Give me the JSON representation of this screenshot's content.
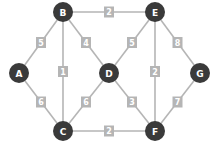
{
  "graph": {
    "node_color": "#3a3a3a",
    "edge_color": "#b5b5b5",
    "nodes": [
      {
        "id": "A",
        "x": 19,
        "y": 73
      },
      {
        "id": "B",
        "x": 63,
        "y": 12
      },
      {
        "id": "C",
        "x": 63,
        "y": 131
      },
      {
        "id": "D",
        "x": 109,
        "y": 73
      },
      {
        "id": "E",
        "x": 155,
        "y": 12
      },
      {
        "id": "F",
        "x": 155,
        "y": 131
      },
      {
        "id": "G",
        "x": 200,
        "y": 73
      }
    ],
    "edges": [
      {
        "from": "A",
        "to": "B",
        "weight": "5"
      },
      {
        "from": "A",
        "to": "C",
        "weight": "6"
      },
      {
        "from": "B",
        "to": "C",
        "weight": "1"
      },
      {
        "from": "B",
        "to": "D",
        "weight": "4"
      },
      {
        "from": "B",
        "to": "E",
        "weight": "2"
      },
      {
        "from": "C",
        "to": "D",
        "weight": "6"
      },
      {
        "from": "C",
        "to": "F",
        "weight": "2"
      },
      {
        "from": "D",
        "to": "E",
        "weight": "5"
      },
      {
        "from": "D",
        "to": "F",
        "weight": "3"
      },
      {
        "from": "E",
        "to": "F",
        "weight": "2"
      },
      {
        "from": "E",
        "to": "G",
        "weight": "8"
      },
      {
        "from": "F",
        "to": "G",
        "weight": "7"
      }
    ]
  }
}
